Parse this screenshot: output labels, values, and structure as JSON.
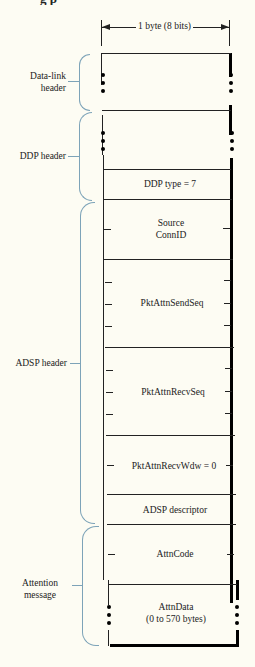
{
  "figure": {
    "title_fragment": "Figure: ADSP attention packet format",
    "width_label": "1 byte (8 bits)",
    "groups": [
      {
        "name": "Data-link header",
        "lines": [
          "Data-link",
          "header"
        ]
      },
      {
        "name": "DDP header",
        "lines": [
          "DDP header"
        ]
      },
      {
        "name": "ADSP header",
        "lines": [
          "ADSP header"
        ]
      },
      {
        "name": "Attention message",
        "lines": [
          "Attention",
          "message"
        ]
      }
    ],
    "fields": [
      {
        "label": "",
        "group": "Data-link header",
        "variable_length": true
      },
      {
        "label": "",
        "group": "DDP header",
        "variable_length": true
      },
      {
        "label": "DDP type = 7",
        "group": "DDP header",
        "bytes": 1
      },
      {
        "label_lines": [
          "Source",
          "ConnID"
        ],
        "group": "ADSP header",
        "bytes": 2
      },
      {
        "label": "PktAttnSendSeq",
        "group": "ADSP header",
        "bytes": 4
      },
      {
        "label": "PktAttnRecvSeq",
        "group": "ADSP header",
        "bytes": 4
      },
      {
        "label": "PktAttnRecvWdw = 0",
        "group": "ADSP header",
        "bytes": 2
      },
      {
        "label": "ADSP descriptor",
        "group": "ADSP header",
        "bytes": 1
      },
      {
        "label": "AttnCode",
        "group": "Attention message",
        "bytes": 2
      },
      {
        "label_lines": [
          "AttnData",
          "(0 to 570 bytes)"
        ],
        "group": "Attention message",
        "variable_length": true
      }
    ]
  },
  "text": {
    "title": "g                             p",
    "byte": "1 byte (8 bits)",
    "g0a": "Data-link",
    "g0b": "header",
    "g1": "DDP header",
    "g2": "ADSP header",
    "g3a": "Attention",
    "g3b": "message",
    "f_ddptype": "DDP type = 7",
    "f_src1": "Source",
    "f_src2": "ConnID",
    "f_send": "PktAttnSendSeq",
    "f_recv": "PktAttnRecvSeq",
    "f_wdw": "PktAttnRecvWdw = 0",
    "f_desc": "ADSP descriptor",
    "f_code": "AttnCode",
    "f_data1": "AttnData",
    "f_data2": "(0 to 570 bytes)"
  },
  "colors": {
    "background": "#fdfcf3",
    "line": "#222222",
    "bracket": "#7da3b8"
  }
}
